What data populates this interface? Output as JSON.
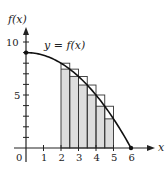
{
  "chart_data": {
    "type": "line",
    "title": "",
    "xlabel": "x",
    "ylabel": "f(x)",
    "curve_label": "y = f(x)",
    "function_model": "f(x) = 9 - x^2/4",
    "xlim": [
      0,
      6
    ],
    "ylim": [
      0,
      10
    ],
    "x_ticks": [
      "0",
      "1",
      "2",
      "3",
      "4",
      "5",
      "6"
    ],
    "y_tick_labels": [
      "5",
      "10"
    ],
    "y_ticks_minor": [
      1,
      2,
      3,
      4,
      5,
      6,
      7,
      8,
      9,
      10
    ],
    "curve_points": {
      "x": [
        0,
        1,
        2,
        2.5,
        3,
        3.5,
        4,
        4.5,
        5,
        6
      ],
      "y": [
        9,
        8.75,
        8,
        7.44,
        6.75,
        5.94,
        5,
        3.94,
        2.75,
        0
      ]
    },
    "rectangles": {
      "description": "Six subintervals of width 0.5 on [2,5]; upper (circumscribed) boxes outlined, lower (inscribed) regions shaded",
      "intervals": [
        [
          2,
          2.5
        ],
        [
          2.5,
          3
        ],
        [
          3,
          3.5
        ],
        [
          3.5,
          4
        ],
        [
          4,
          4.5
        ],
        [
          4.5,
          5
        ]
      ],
      "upper_heights": [
        8,
        7.44,
        6.75,
        5.94,
        5,
        3.94
      ],
      "lower_heights": [
        7.44,
        6.75,
        5.94,
        5,
        3.94,
        2.75
      ]
    },
    "grid": false,
    "legend": null
  },
  "labels": {
    "y_axis": "f(x)",
    "x_axis": "x",
    "curve": "y = f(x)",
    "origin": "0",
    "x1": "1",
    "x2": "2",
    "x3": "3",
    "x4": "4",
    "x5": "5",
    "x6": "6",
    "y5": "5",
    "y10": "10"
  },
  "colors": {
    "axis": "#222222",
    "curve": "#111111",
    "shade": "#d6d6d6",
    "rect_stroke": "#333333"
  }
}
